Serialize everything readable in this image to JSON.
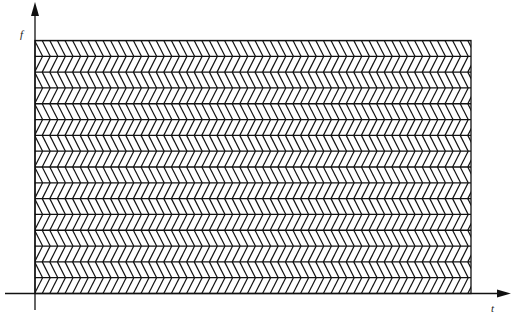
{
  "diagram": {
    "type": "time-frequency tiling",
    "y_axis_label": "f",
    "x_axis_label": "t",
    "rows": 16,
    "row_patterns": [
      "backslash",
      "slash"
    ],
    "line_color": "#111111",
    "background": "#ffffff"
  }
}
